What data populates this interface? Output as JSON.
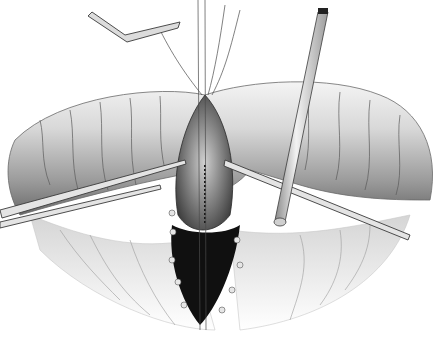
{
  "image": {
    "kind": "surgical-illustration",
    "style": "grayscale pencil rendering",
    "width": 446,
    "height": 360,
    "background": "#ffffff",
    "subjects": [
      "bowel-loop",
      "incision-with-running-suture",
      "retractor-clamp",
      "forceps-left",
      "forceps-right",
      "drainage-tube",
      "mesentery",
      "dark-cavity-with-sutures"
    ],
    "colors": {
      "tissue_light": "#e6e6e6",
      "tissue_mid": "#bdbdbd",
      "tissue_dark": "#7a7a7a",
      "cavity": "#101010",
      "instrument": "#d9d9d9",
      "line": "#3a3a3a"
    }
  }
}
